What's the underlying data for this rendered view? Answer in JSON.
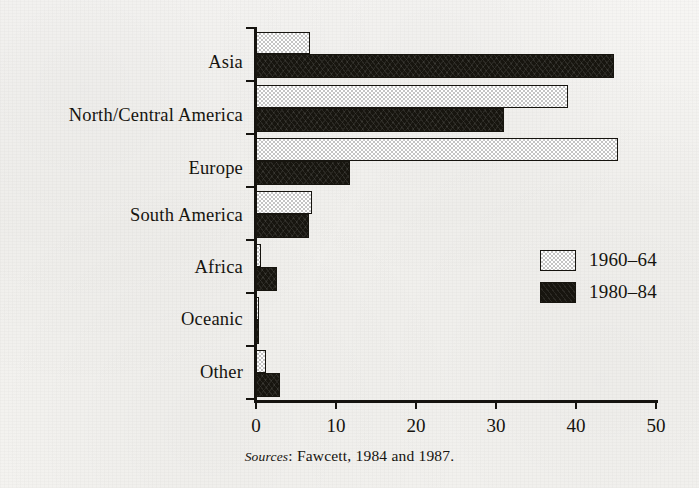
{
  "chart_data": {
    "type": "bar",
    "orientation": "horizontal",
    "title": "",
    "subtitle": "",
    "xlabel": "",
    "ylabel": "",
    "xlim": [
      0,
      50
    ],
    "xticks": [
      0,
      10,
      20,
      30,
      40,
      50
    ],
    "xtick_labels": [
      "0",
      "10",
      "20",
      "30",
      "40",
      "50"
    ],
    "grid": false,
    "legend_position": "center-right",
    "categories": [
      "Asia",
      "North/Central America",
      "Europe",
      "South America",
      "Africa",
      "Oceanic",
      "Other"
    ],
    "series": [
      {
        "name": "1960–64",
        "style": "stippled-light",
        "color": "#c4c4c4",
        "values": [
          6.8,
          39.0,
          45.2,
          7.0,
          0.6,
          0.4,
          1.2
        ]
      },
      {
        "name": "1980–84",
        "style": "solid-black",
        "color": "#17150f",
        "values": [
          44.7,
          31.0,
          11.7,
          6.6,
          2.6,
          0.4,
          3.0
        ]
      }
    ],
    "source_note": {
      "label": "Sources",
      "text": ": Fawcett, 1984 and 1987."
    }
  },
  "axis": {
    "x_tick_labels": [
      "0",
      "10",
      "20",
      "30",
      "40",
      "50"
    ]
  },
  "legend": {
    "items": [
      {
        "label": "1960–64",
        "swatch": "light-stipple-swatch"
      },
      {
        "label": "1980–84",
        "swatch": "dark-solid-swatch"
      }
    ]
  },
  "labels": {
    "categories": [
      "Asia",
      "North/Central America",
      "Europe",
      "South America",
      "Africa",
      "Oceanic",
      "Other"
    ]
  },
  "source": {
    "prefix": "Sources",
    "body": ": Fawcett, 1984 and 1987."
  },
  "colors": {
    "paper": "#f4f3f0",
    "ink": "#16140f",
    "series_light": "#c4c4c4",
    "series_dark": "#17150f"
  }
}
